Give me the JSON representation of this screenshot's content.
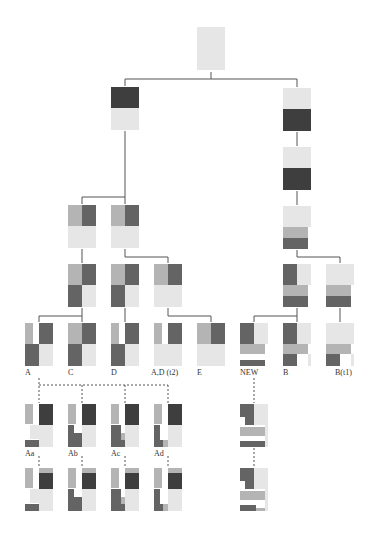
{
  "colors": {
    "light": "#e6e6e6",
    "medium": "#b4b4b4",
    "dark": "#646464",
    "darkest": "#3e3e3e",
    "line": "#555555"
  },
  "labels": {
    "A": "A",
    "C": "C",
    "D": "D",
    "AD_t2": "A,D (t2)",
    "E": "E",
    "NEW": "NEW",
    "B": "B",
    "B_t1": "B(t1)",
    "Aa": "Aa",
    "Ab": "Ab",
    "Ac": "Ac",
    "Ad": "Ad"
  },
  "nodes": [
    {
      "id": "root",
      "x": 197,
      "y": 27,
      "cells": [
        [
          0,
          0,
          28,
          43,
          "light"
        ]
      ]
    },
    {
      "id": "L1",
      "x": 111,
      "y": 87,
      "cells": [
        [
          0,
          0,
          28,
          21,
          "darkest"
        ],
        [
          0,
          21,
          28,
          22,
          "light"
        ]
      ]
    },
    {
      "id": "R1",
      "x": 283,
      "y": 88,
      "cells": [
        [
          0,
          0,
          28,
          21,
          "light"
        ],
        [
          0,
          21,
          28,
          22,
          "darkest"
        ]
      ]
    },
    {
      "id": "R2",
      "x": 283,
      "y": 147,
      "cells": [
        [
          0,
          0,
          28,
          21,
          "light"
        ],
        [
          0,
          21,
          28,
          22,
          "darkest"
        ]
      ]
    },
    {
      "id": "R3",
      "x": 283,
      "y": 206,
      "cells": [
        [
          0,
          0,
          28,
          21,
          "light"
        ],
        [
          0,
          21,
          25,
          11,
          "medium"
        ],
        [
          0,
          32,
          25,
          11,
          "dark"
        ]
      ]
    },
    {
      "id": "L3a",
      "x": 68,
      "y": 205,
      "cells": [
        [
          0,
          0,
          14,
          21,
          "medium"
        ],
        [
          14,
          0,
          14,
          21,
          "dark"
        ],
        [
          0,
          21,
          28,
          22,
          "light"
        ]
      ]
    },
    {
      "id": "L3b",
      "x": 111,
      "y": 205,
      "cells": [
        [
          0,
          0,
          14,
          21,
          "medium"
        ],
        [
          14,
          0,
          14,
          21,
          "dark"
        ],
        [
          0,
          21,
          28,
          22,
          "light"
        ]
      ]
    },
    {
      "id": "L4a",
      "x": 68,
      "y": 264,
      "cells": [
        [
          0,
          0,
          14,
          21,
          "medium"
        ],
        [
          14,
          0,
          14,
          21,
          "dark"
        ],
        [
          0,
          21,
          14,
          22,
          "dark"
        ],
        [
          14,
          21,
          14,
          22,
          "light"
        ]
      ]
    },
    {
      "id": "L4b",
      "x": 111,
      "y": 264,
      "cells": [
        [
          0,
          0,
          14,
          21,
          "medium"
        ],
        [
          14,
          0,
          14,
          21,
          "dark"
        ],
        [
          0,
          21,
          14,
          22,
          "dark"
        ],
        [
          14,
          21,
          14,
          22,
          "light"
        ]
      ]
    },
    {
      "id": "L4c",
      "x": 154,
      "y": 264,
      "cells": [
        [
          0,
          0,
          14,
          21,
          "medium"
        ],
        [
          14,
          0,
          14,
          21,
          "dark"
        ],
        [
          0,
          21,
          28,
          22,
          "light"
        ]
      ]
    },
    {
      "id": "R4a",
      "x": 283,
      "y": 264,
      "cells": [
        [
          0,
          0,
          14,
          21,
          "dark"
        ],
        [
          14,
          0,
          14,
          21,
          "light"
        ],
        [
          0,
          21,
          25,
          11,
          "medium"
        ],
        [
          0,
          32,
          25,
          11,
          "dark"
        ]
      ]
    },
    {
      "id": "R4b",
      "x": 326,
      "y": 264,
      "cells": [
        [
          0,
          0,
          28,
          21,
          "light"
        ],
        [
          0,
          21,
          25,
          11,
          "medium"
        ],
        [
          0,
          32,
          25,
          11,
          "dark"
        ]
      ]
    },
    {
      "id": "A",
      "x": 25,
      "y": 323,
      "label": "A",
      "cells": [
        [
          0,
          0,
          8,
          21,
          "medium"
        ],
        [
          14,
          0,
          14,
          21,
          "dark"
        ],
        [
          0,
          21,
          14,
          22,
          "dark"
        ],
        [
          14,
          21,
          14,
          22,
          "light"
        ]
      ]
    },
    {
      "id": "C",
      "x": 68,
      "y": 323,
      "label": "C",
      "cells": [
        [
          0,
          0,
          14,
          21,
          "medium"
        ],
        [
          14,
          0,
          14,
          21,
          "dark"
        ],
        [
          0,
          21,
          14,
          22,
          "dark"
        ],
        [
          14,
          21,
          14,
          22,
          "light"
        ]
      ]
    },
    {
      "id": "D",
      "x": 111,
      "y": 323,
      "label": "D",
      "cells": [
        [
          0,
          0,
          8,
          21,
          "medium"
        ],
        [
          14,
          0,
          14,
          21,
          "dark"
        ],
        [
          0,
          21,
          14,
          22,
          "dark"
        ],
        [
          14,
          21,
          14,
          22,
          "light"
        ]
      ]
    },
    {
      "id": "AD_t2",
      "x": 154,
      "y": 323,
      "label": "AD_t2",
      "cells": [
        [
          0,
          0,
          8,
          21,
          "medium"
        ],
        [
          14,
          0,
          14,
          21,
          "dark"
        ],
        [
          0,
          21,
          28,
          22,
          "light"
        ]
      ]
    },
    {
      "id": "E",
      "x": 197,
      "y": 323,
      "label": "E",
      "cells": [
        [
          0,
          0,
          14,
          21,
          "medium"
        ],
        [
          14,
          0,
          14,
          21,
          "dark"
        ],
        [
          0,
          21,
          28,
          22,
          "light"
        ]
      ]
    },
    {
      "id": "NEW",
      "x": 240,
      "y": 323,
      "label": "NEW",
      "cells": [
        [
          0,
          0,
          14,
          21,
          "dark"
        ],
        [
          14,
          0,
          14,
          21,
          "light"
        ],
        [
          0,
          21,
          25,
          10,
          "medium"
        ],
        [
          0,
          37,
          25,
          6,
          "dark"
        ]
      ]
    },
    {
      "id": "B",
      "x": 283,
      "y": 323,
      "label": "B",
      "cells": [
        [
          0,
          0,
          14,
          21,
          "dark"
        ],
        [
          14,
          0,
          14,
          21,
          "light"
        ],
        [
          0,
          21,
          25,
          10,
          "medium"
        ],
        [
          0,
          31,
          14,
          12,
          "dark"
        ],
        [
          25,
          31,
          3,
          12,
          "light"
        ]
      ]
    },
    {
      "id": "B_t1",
      "x": 326,
      "y": 323,
      "label": "B_t1",
      "cells": [
        [
          0,
          0,
          28,
          21,
          "light"
        ],
        [
          0,
          21,
          25,
          10,
          "medium"
        ],
        [
          0,
          31,
          14,
          12,
          "dark"
        ],
        [
          25,
          31,
          3,
          12,
          "light"
        ]
      ]
    },
    {
      "id": "Aa",
      "x": 25,
      "y": 404,
      "label": "Aa",
      "cells": [
        [
          0,
          0,
          8,
          20,
          "medium"
        ],
        [
          14,
          0,
          14,
          21,
          "darkest"
        ],
        [
          5,
          21,
          9,
          14,
          "light"
        ],
        [
          14,
          21,
          14,
          22,
          "light"
        ],
        [
          0,
          36,
          14,
          7,
          "dark"
        ]
      ]
    },
    {
      "id": "Ab",
      "x": 68,
      "y": 404,
      "label": "Ab",
      "cells": [
        [
          0,
          0,
          8,
          20,
          "medium"
        ],
        [
          14,
          0,
          14,
          21,
          "darkest"
        ],
        [
          0,
          21,
          6,
          15,
          "dark"
        ],
        [
          6,
          29,
          8,
          7,
          "dark"
        ],
        [
          14,
          21,
          14,
          22,
          "light"
        ],
        [
          0,
          36,
          14,
          7,
          "dark"
        ]
      ]
    },
    {
      "id": "Ac",
      "x": 111,
      "y": 404,
      "label": "Ac",
      "cells": [
        [
          0,
          0,
          8,
          20,
          "medium"
        ],
        [
          14,
          0,
          14,
          21,
          "darkest"
        ],
        [
          0,
          21,
          10,
          15,
          "dark"
        ],
        [
          10,
          29,
          4,
          7,
          "medium"
        ],
        [
          14,
          21,
          14,
          22,
          "light"
        ],
        [
          0,
          36,
          14,
          7,
          "dark"
        ]
      ]
    },
    {
      "id": "Ad",
      "x": 154,
      "y": 404,
      "label": "Ad",
      "cells": [
        [
          0,
          0,
          8,
          20,
          "medium"
        ],
        [
          14,
          0,
          14,
          21,
          "darkest"
        ],
        [
          0,
          21,
          6,
          15,
          "dark"
        ],
        [
          14,
          21,
          14,
          22,
          "light"
        ],
        [
          0,
          36,
          9,
          7,
          "dark"
        ],
        [
          9,
          36,
          5,
          7,
          "medium"
        ]
      ]
    },
    {
      "id": "NEWa",
      "x": 240,
      "y": 404,
      "cells": [
        [
          0,
          0,
          14,
          13,
          "dark"
        ],
        [
          14,
          0,
          14,
          21,
          "light"
        ],
        [
          5,
          13,
          9,
          8,
          "dark"
        ],
        [
          0,
          23,
          25,
          9,
          "medium"
        ],
        [
          0,
          37,
          25,
          6,
          "dark"
        ],
        [
          25,
          21,
          3,
          22,
          "light"
        ]
      ]
    },
    {
      "id": "Aa2",
      "x": 25,
      "y": 468,
      "cells": [
        [
          0,
          0,
          8,
          20,
          "medium"
        ],
        [
          14,
          0,
          14,
          5,
          "medium"
        ],
        [
          14,
          5,
          14,
          16,
          "darkest"
        ],
        [
          5,
          21,
          9,
          14,
          "light"
        ],
        [
          14,
          21,
          14,
          22,
          "light"
        ],
        [
          0,
          36,
          14,
          7,
          "dark"
        ]
      ]
    },
    {
      "id": "Ab2",
      "x": 68,
      "y": 468,
      "cells": [
        [
          0,
          0,
          8,
          20,
          "medium"
        ],
        [
          14,
          0,
          14,
          5,
          "medium"
        ],
        [
          14,
          5,
          14,
          16,
          "darkest"
        ],
        [
          0,
          21,
          6,
          15,
          "dark"
        ],
        [
          6,
          29,
          8,
          7,
          "dark"
        ],
        [
          14,
          21,
          14,
          22,
          "light"
        ],
        [
          0,
          36,
          14,
          7,
          "dark"
        ]
      ]
    },
    {
      "id": "Ac2",
      "x": 111,
      "y": 468,
      "cells": [
        [
          0,
          0,
          8,
          20,
          "medium"
        ],
        [
          14,
          0,
          14,
          5,
          "medium"
        ],
        [
          14,
          5,
          14,
          16,
          "darkest"
        ],
        [
          0,
          21,
          10,
          15,
          "dark"
        ],
        [
          10,
          29,
          4,
          7,
          "medium"
        ],
        [
          14,
          21,
          14,
          22,
          "light"
        ],
        [
          0,
          36,
          14,
          7,
          "dark"
        ]
      ]
    },
    {
      "id": "Ad2",
      "x": 154,
      "y": 468,
      "cells": [
        [
          0,
          0,
          8,
          20,
          "medium"
        ],
        [
          14,
          0,
          14,
          5,
          "medium"
        ],
        [
          14,
          5,
          14,
          16,
          "darkest"
        ],
        [
          0,
          21,
          6,
          15,
          "dark"
        ],
        [
          14,
          21,
          14,
          22,
          "light"
        ],
        [
          0,
          36,
          9,
          7,
          "dark"
        ],
        [
          9,
          36,
          5,
          7,
          "medium"
        ]
      ]
    },
    {
      "id": "NEWb",
      "x": 240,
      "y": 468,
      "cells": [
        [
          0,
          0,
          14,
          13,
          "dark"
        ],
        [
          14,
          0,
          14,
          21,
          "light"
        ],
        [
          5,
          13,
          9,
          8,
          "dark"
        ],
        [
          0,
          23,
          25,
          9,
          "medium"
        ],
        [
          0,
          37,
          16,
          6,
          "dark"
        ],
        [
          16,
          40,
          9,
          3,
          "medium"
        ],
        [
          25,
          21,
          3,
          22,
          "light"
        ]
      ]
    }
  ],
  "connectors": [
    "M211 72 L211 79 M125 79 L297 79 M125 79 L125 86 M297 79 L297 87",
    "M125 131 L125 197 M82 197 L125 197 M82 197 L82 204 M125 197 L125 204",
    "M297 132 L297 146 M297 191 L297 205",
    "M82 249 L82 263 M125 249 L125 257 M125 257 L168 257 M168 257 L168 263",
    "M297 250 L297 257 L340 257 L340 263",
    "M82 308 L82 316 M39 316 L82 316 M39 316 L39 322 M82 316 L82 322",
    "M125 308 L125 322 M168 308 L168 316 L211 316 L211 322",
    "M297 308 L297 316 L254 316 L254 322 M297 316 L297 322 M340 308 L340 322"
  ],
  "dashed": [
    "M39 378 L39 403 M39 385 L168 385 M82 385 L82 403 M125 385 L125 403 M168 385 L168 403",
    "M39 456 L39 467 M82 456 L82 467 M125 456 L125 467 M168 456 L168 467",
    "M254 378 L254 403 M254 448 L254 467"
  ],
  "label_positions": {
    "A": [
      25,
      369
    ],
    "C": [
      68,
      369
    ],
    "D": [
      111,
      369
    ],
    "AD_t2": [
      151,
      369
    ],
    "E": [
      197,
      369
    ],
    "NEW": [
      240,
      369
    ],
    "B": [
      283,
      369
    ],
    "B_t1": [
      335,
      369
    ],
    "Aa": [
      25,
      450
    ],
    "Ab": [
      68,
      450
    ],
    "Ac": [
      111,
      450
    ],
    "Ad": [
      154,
      450
    ]
  }
}
